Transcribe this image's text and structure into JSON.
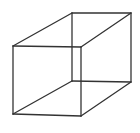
{
  "diagram": {
    "type": "wireframe-cube",
    "line_color": "#333333",
    "background_color": "#ffffff",
    "vertices": {
      "front_top_left": "front-top-left",
      "front_top_right": "front-top-right",
      "front_bottom_left": "front-bottom-left",
      "front_bottom_right": "front-bottom-right",
      "back_top_left": "back-top-left",
      "back_top_right": "back-top-right",
      "back_bottom_left": "back-bottom-left",
      "back_bottom_right": "back-bottom-right"
    },
    "edges": [
      {
        "name": "front-top-edge",
        "from": "front_top_left",
        "to": "front_top_right"
      },
      {
        "name": "front-bottom-edge",
        "from": "front_bottom_left",
        "to": "front_bottom_right"
      },
      {
        "name": "front-left-edge",
        "from": "front_top_left",
        "to": "front_bottom_left"
      },
      {
        "name": "front-right-edge",
        "from": "front_top_right",
        "to": "front_bottom_right"
      },
      {
        "name": "back-top-edge",
        "from": "back_top_left",
        "to": "back_top_right"
      },
      {
        "name": "back-bottom-edge",
        "from": "back_bottom_left",
        "to": "back_bottom_right"
      },
      {
        "name": "back-left-edge",
        "from": "back_top_left",
        "to": "back_bottom_left"
      },
      {
        "name": "back-right-edge",
        "from": "back_top_right",
        "to": "back_bottom_right"
      },
      {
        "name": "top-left-depth-edge",
        "from": "front_top_left",
        "to": "back_top_left"
      },
      {
        "name": "top-right-depth-edge",
        "from": "front_top_right",
        "to": "back_top_right"
      },
      {
        "name": "bottom-left-depth-edge",
        "from": "front_bottom_left",
        "to": "back_bottom_left"
      },
      {
        "name": "bottom-right-depth-edge",
        "from": "front_bottom_right",
        "to": "back_bottom_right"
      }
    ]
  }
}
